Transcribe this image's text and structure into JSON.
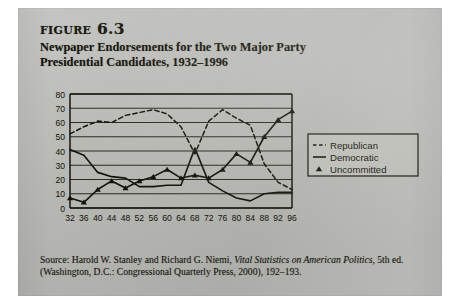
{
  "figure": {
    "label": "figure 6.3",
    "title_line_1": "Newpaper Endorsements for the Two Major Party",
    "title_line_2": "Presidential Candidates, 1932–1996"
  },
  "source": {
    "prefix": "Source: Harold W. Stanley and Richard G. Niemi, ",
    "italic_work": "Vital Statistics on American Politics",
    "suffix": ", 5th ed.",
    "line_2": "(Washington, D.C.: Congressional Quarterly Press, 2000), 192–193."
  },
  "legend": {
    "republican": "Republican",
    "democratic": "Democratic",
    "uncommitted": "Uncommitted"
  },
  "colors": {
    "ink": "#121208",
    "page": "#b9b9b5",
    "plot_background": "#b3b3ae",
    "gridline": "#2a2a22",
    "frame": "#14140c"
  },
  "chart_data": {
    "type": "line",
    "title": "Newpaper Endorsements for the Two Major Party Presidential Candidates, 1932–1996",
    "xlabel": "",
    "ylabel": "",
    "xlim": [
      32,
      96
    ],
    "ylim": [
      0,
      80
    ],
    "ytick_step": 10,
    "grid": true,
    "legend_position": "right",
    "categories": [
      32,
      36,
      40,
      44,
      48,
      52,
      56,
      60,
      64,
      68,
      72,
      76,
      80,
      84,
      88,
      92,
      96
    ],
    "xtick_labels": [
      "32",
      "36",
      "40",
      "44",
      "48",
      "52",
      "56",
      "60",
      "64",
      "68",
      "72",
      "76",
      "80",
      "84",
      "88",
      "92",
      "96"
    ],
    "ytick_labels": [
      "0",
      "10",
      "20",
      "30",
      "40",
      "50",
      "60",
      "70",
      "80"
    ],
    "series": [
      {
        "name": "Republican",
        "style": "dashed",
        "marker": "none",
        "values": [
          52,
          57,
          61,
          60,
          65,
          67,
          69,
          66,
          57,
          38,
          61,
          69,
          63,
          58,
          31,
          18,
          13
        ]
      },
      {
        "name": "Democratic",
        "style": "solid",
        "marker": "none",
        "values": [
          41,
          37,
          25,
          22,
          21,
          15,
          15,
          16,
          16,
          42,
          18,
          12,
          7,
          5,
          10,
          11,
          11
        ]
      },
      {
        "name": "Uncommitted",
        "style": "solid",
        "marker": "triangle",
        "values": [
          7,
          4,
          13,
          19,
          14,
          19,
          22,
          27,
          21,
          23,
          21,
          27,
          38,
          32,
          50,
          62,
          68
        ]
      }
    ]
  }
}
